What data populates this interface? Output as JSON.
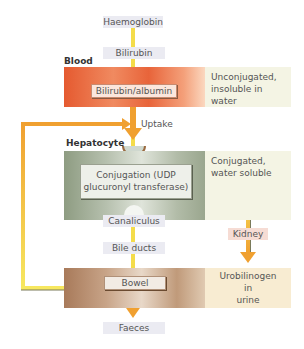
{
  "diagram": {
    "title_nodes": {
      "haemoglobin": "Haemoglobin",
      "bilirubin": "Bilirubin",
      "uptake": "Uptake",
      "canaliculus": "Canaliculus",
      "bile_ducts": "Bile ducts",
      "kidney": "Kidney",
      "faeces": "Faeces"
    },
    "sections": [
      {
        "label": "Blood",
        "box": "Bilirubin/albumin",
        "note": "Unconjugated, insoluble in water",
        "note_lines": [
          "Unconjugated,",
          "insoluble in water"
        ],
        "color": "#e8643a"
      },
      {
        "label": "Hepatocyte",
        "box": "Conjugation (UDP glucuronyl transferase)",
        "box_lines": [
          "Conjugation (UDP",
          "glucuronyl transferase)"
        ],
        "note": "Conjugated, water soluble",
        "note_lines": [
          "Conjugated,",
          "water soluble"
        ],
        "color": "#8e9c82"
      },
      {
        "label": "",
        "box": "Bowel",
        "note": "Urobilinogen in urine",
        "note_lines": [
          "Urobilinogen",
          "in",
          "urine"
        ],
        "color": "#b48a6a"
      }
    ],
    "colors": {
      "arrow_orange": "#f0a030",
      "arrow_yellow": "#f5e04a",
      "info_bg_light": "#f4f4e4",
      "urine_bg": "#f8ecd2",
      "pill_bg": "#ebebf2",
      "kidney_bg": "#f6dcd4"
    }
  }
}
